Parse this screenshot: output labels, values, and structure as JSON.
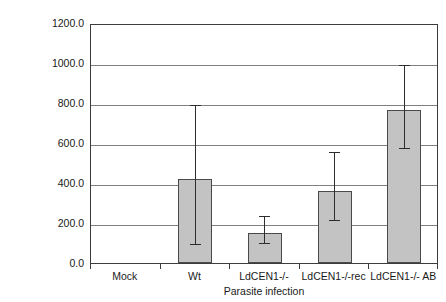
{
  "chart_data": {
    "type": "bar",
    "title": "",
    "xlabel": "Parasite infection",
    "ylabel": "Relative copy number",
    "categories": [
      "Mock",
      "Wt",
      "LdCEN1-/-",
      "LdCEN1-/-rec",
      "LdCEN1-/- AB"
    ],
    "values": [
      0,
      420,
      150,
      360,
      765
    ],
    "errors_upper": [
      0,
      365,
      80,
      190,
      220
    ],
    "errors_lower": [
      0,
      330,
      55,
      150,
      195
    ],
    "error_upper_abs": [
      0,
      785,
      230,
      550,
      985
    ],
    "error_lower_abs": [
      0,
      90,
      95,
      210,
      570
    ],
    "ylim": [
      0,
      1200
    ],
    "ytick_values": [
      0,
      200,
      400,
      600,
      800,
      1000,
      1200
    ],
    "ytick_labels": [
      "0.0",
      "200.0",
      "400.0",
      "600.0",
      "800.0",
      "1000.0",
      "1200.0"
    ],
    "grid": true,
    "legend": null,
    "bar_color": "#c3c3c3",
    "bar_edge_color": "#4a4a4a",
    "grid_color": "#808080",
    "axis_color": "#3c3c3c",
    "error_color": "#2d2d2d"
  }
}
